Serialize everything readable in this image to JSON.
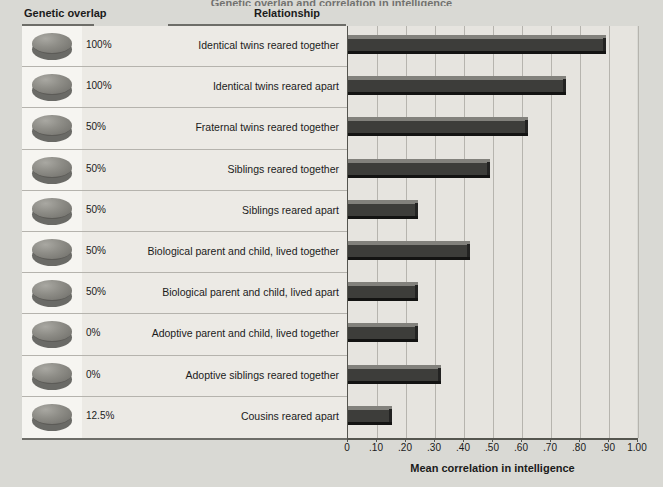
{
  "figure": {
    "title_sliver": "Genetic overlap and correlation in intelligence",
    "source_line1": "Source: From Weiten, Psychology, 8/e. Copyright © 2010 Wadsworth, a part of Cengage Learning, Inc.",
    "source_line2": "Reproduced by permission. www.cengage.com/permissions."
  },
  "headers": {
    "genetic_overlap": "Genetic overlap",
    "relationship": "Relationship"
  },
  "rows": [
    {
      "percent": "100%",
      "relationship": "Identical twins reared together",
      "value": 0.89,
      "coin_icon": "coin-disc-icon"
    },
    {
      "percent": "100%",
      "relationship": "Identical twins reared apart",
      "value": 0.75,
      "coin_icon": "coin-disc-icon"
    },
    {
      "percent": "50%",
      "relationship": "Fraternal twins reared together",
      "value": 0.62,
      "coin_icon": "coin-disc-icon"
    },
    {
      "percent": "50%",
      "relationship": "Siblings reared together",
      "value": 0.49,
      "coin_icon": "coin-disc-icon"
    },
    {
      "percent": "50%",
      "relationship": "Siblings reared apart",
      "value": 0.24,
      "coin_icon": "coin-disc-icon"
    },
    {
      "percent": "50%",
      "relationship": "Biological parent and child, lived together",
      "value": 0.42,
      "coin_icon": "coin-disc-icon"
    },
    {
      "percent": "50%",
      "relationship": "Biological parent and child, lived apart",
      "value": 0.24,
      "coin_icon": "coin-disc-icon"
    },
    {
      "percent": "0%",
      "relationship": "Adoptive parent and child, lived together",
      "value": 0.24,
      "coin_icon": "coin-disc-icon"
    },
    {
      "percent": "0%",
      "relationship": "Adoptive siblings reared together",
      "value": 0.32,
      "coin_icon": "coin-disc-icon"
    },
    {
      "percent": "12.5%",
      "relationship": "Cousins reared apart",
      "value": 0.15,
      "coin_icon": "coin-disc-icon"
    }
  ],
  "axis": {
    "label": "Mean correlation in intelligence",
    "ticks": [
      "0",
      ".10",
      ".20",
      ".30",
      ".40",
      ".50",
      ".60",
      ".70",
      ".80",
      ".90",
      "1.00"
    ],
    "tick_values": [
      0,
      0.1,
      0.2,
      0.3,
      0.4,
      0.5,
      0.6,
      0.7,
      0.8,
      0.9,
      1.0
    ],
    "min": 0,
    "max": 1.0
  },
  "colors": {
    "background": "#d9d9d4",
    "panel": "#eceae5",
    "plot_background": "#e6e4df",
    "bar_face": "#3d3d3a",
    "bar_highlight": "#82817c",
    "bar_shadow": "#131312",
    "gridline": "#b6b4ae",
    "axis": "#55554f",
    "text": "#1b1b1b"
  },
  "chart_data": {
    "type": "bar",
    "orientation": "horizontal",
    "title": "Genetic overlap and correlation in intelligence",
    "xlabel": "Mean correlation in intelligence",
    "ylabel": "Relationship",
    "xlim": [
      0,
      1.0
    ],
    "xticks": [
      0,
      0.1,
      0.2,
      0.3,
      0.4,
      0.5,
      0.6,
      0.7,
      0.8,
      0.9,
      1.0
    ],
    "xticklabels": [
      "0",
      ".10",
      ".20",
      ".30",
      ".40",
      ".50",
      ".60",
      ".70",
      ".80",
      ".90",
      "1.00"
    ],
    "grid": true,
    "legend": null,
    "categories": [
      "Identical twins reared together",
      "Identical twins reared apart",
      "Fraternal twins reared together",
      "Siblings reared together",
      "Siblings reared apart",
      "Biological parent and child, lived together",
      "Biological parent and child, lived apart",
      "Adoptive parent and child, lived together",
      "Adoptive siblings reared together",
      "Cousins reared apart"
    ],
    "values": [
      0.89,
      0.75,
      0.62,
      0.49,
      0.24,
      0.42,
      0.24,
      0.24,
      0.32,
      0.15
    ],
    "genetic_overlap": [
      "100%",
      "100%",
      "50%",
      "50%",
      "50%",
      "50%",
      "50%",
      "0%",
      "0%",
      "12.5%"
    ]
  }
}
